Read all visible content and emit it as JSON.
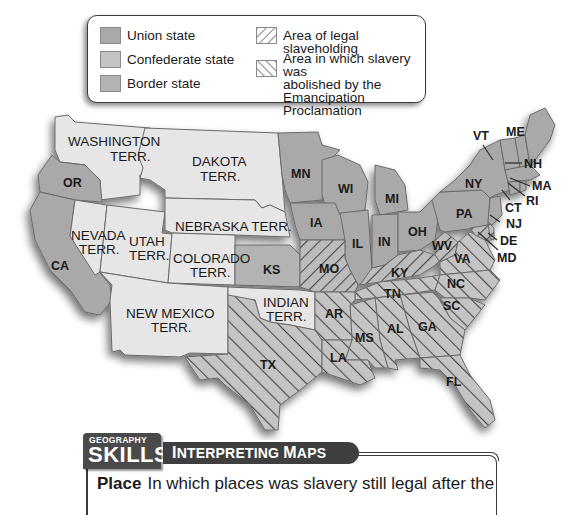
{
  "legend": {
    "items": [
      {
        "id": "union",
        "label": "Union state",
        "color": "#a9a9a9",
        "pattern": "solid"
      },
      {
        "id": "confederate",
        "label": "Confederate state",
        "color": "#c4c4c4",
        "pattern": "solid"
      },
      {
        "id": "border",
        "label": "Border state",
        "color": "#b3b3b3",
        "pattern": "solid"
      },
      {
        "id": "legal",
        "label": "Area of legal slaveholding",
        "color": "#ffffff",
        "pattern": "hatch-forward"
      },
      {
        "id": "abolished",
        "label_lines": [
          "Area in which slavery was",
          "abolished by the",
          "Emancipation Proclamation"
        ],
        "color": "#ffffff",
        "pattern": "hatch-back"
      }
    ]
  },
  "map": {
    "colors": {
      "territory": "#e6e6e6",
      "union": "#a9a9a9",
      "confederate": "#c4c4c4",
      "border": "#bababa",
      "hatch": "#3a3a3a"
    },
    "labels": {
      "washington": [
        "WASHINGTON",
        "TERR."
      ],
      "dakota": [
        "DAKOTA",
        "TERR."
      ],
      "oregon": "OR",
      "nebraska": "NEBRASKA TERR.",
      "nevada": [
        "NEVADA",
        "TERR."
      ],
      "utah": [
        "UTAH",
        "TERR."
      ],
      "colorado": [
        "COLORADO",
        "TERR."
      ],
      "california": "CA",
      "kansas": "KS",
      "new_mexico": [
        "NEW MEXICO",
        "TERR."
      ],
      "indian": [
        "INDIAN",
        "TERR."
      ],
      "texas": "TX",
      "minnesota": "MN",
      "wisconsin": "WI",
      "michigan": "MI",
      "iowa": "IA",
      "illinois": "IL",
      "indiana": "IN",
      "ohio": "OH",
      "missouri": "MO",
      "kentucky": "KY",
      "tennessee": "TN",
      "arkansas": "AR",
      "louisiana": "LA",
      "mississippi": "MS",
      "alabama": "AL",
      "georgia": "GA",
      "florida": "FL",
      "south_carolina": "SC",
      "north_carolina": "NC",
      "virginia": "VA",
      "west_virginia": "WV",
      "pennsylvania": "PA",
      "new_york": "NY",
      "vermont": "VT",
      "maine": "ME",
      "new_hampshire": "NH",
      "massachusetts": "MA",
      "rhode_island": "RI",
      "connecticut": "CT",
      "new_jersey": "NJ",
      "delaware": "DE",
      "maryland": "MD"
    }
  },
  "skills": {
    "badge_top": "GEOGRAPHY",
    "badge_bottom": "SKILLS",
    "banner_first": "I",
    "banner_rest1": "NTERPRETING ",
    "banner_m": "M",
    "banner_rest2": "APS",
    "question_label": "Place",
    "question_text": "In which places was slavery still legal after the"
  }
}
